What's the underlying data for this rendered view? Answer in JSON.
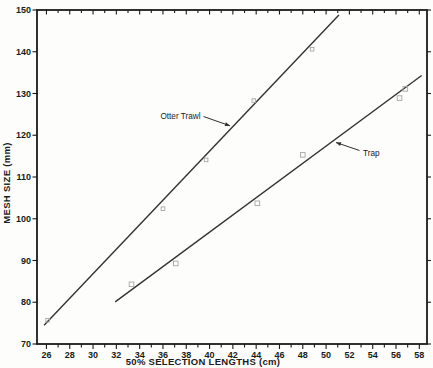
{
  "chart_data": {
    "type": "scatter",
    "title": "",
    "xlabel": "50% SELECTION LENGTHS (cm)",
    "ylabel": "MESH SIZE (mm)",
    "xlim": [
      25.19,
      58.66
    ],
    "ylim": [
      70,
      150
    ],
    "x_tick_labels": [
      26,
      28,
      30,
      32,
      34,
      36,
      38,
      40,
      42,
      44,
      46,
      48,
      50,
      52,
      54,
      56,
      58
    ],
    "x_minor_tick_step": 1,
    "y_tick_labels": [
      70,
      80,
      90,
      100,
      110,
      120,
      130,
      140,
      150
    ],
    "grid": false,
    "legend_position": "inline-annotations",
    "series": [
      {
        "name": "Otter Trawl",
        "marker": "open-square",
        "marker_size": 3.6,
        "points": [
          [
            26.1,
            75.7
          ],
          [
            36.0,
            102.4
          ],
          [
            39.7,
            114.1
          ],
          [
            43.8,
            128.3
          ],
          [
            48.8,
            140.6
          ]
        ],
        "fit_line": [
          [
            25.8,
            74.5
          ],
          [
            51.1,
            148.8
          ]
        ]
      },
      {
        "name": "Trap",
        "marker": "open-square",
        "marker_size": 4.6,
        "points": [
          [
            33.3,
            84.3
          ],
          [
            37.1,
            89.3
          ],
          [
            44.1,
            103.7
          ],
          [
            48.0,
            115.3
          ],
          [
            56.3,
            128.9
          ],
          [
            56.8,
            131.1
          ]
        ],
        "fit_line": [
          [
            31.9,
            80.1
          ],
          [
            58.2,
            134.3
          ]
        ]
      }
    ],
    "annotations": [
      {
        "text": "Otter Trawl",
        "anchor": "end",
        "text_x": 200.5,
        "text_y": 118.5,
        "arrow_from_x": 203.5,
        "arrow_from_y": 116.5,
        "arrow_to_x": 230,
        "arrow_to_y": 125.8
      },
      {
        "text": "Trap",
        "anchor": "start",
        "text_x": 363,
        "text_y": 155.5,
        "arrow_from_x": 359.5,
        "arrow_from_y": 150.5,
        "arrow_to_x": 336,
        "arrow_to_y": 142.5
      }
    ]
  },
  "style": {
    "background": "#fdfdfc",
    "axis_color": "#1b1b1b",
    "line_color": "#333333",
    "marker_color": "#a6a6a6",
    "tick_label_color": "#1b1b1b",
    "annotation_color": "#2e2e2e"
  },
  "layout": {
    "width": 433,
    "height": 368,
    "plot": {
      "left": 37,
      "right": 427,
      "top": 10,
      "bottom": 344
    },
    "xlabel_center_x": 203,
    "xlabel_baseline_y": 364.5,
    "ylabel_center_x": 9.5,
    "ylabel_center_y": 183
  }
}
